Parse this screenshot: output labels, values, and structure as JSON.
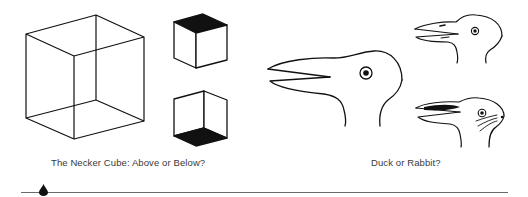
{
  "figures": [
    {
      "id": "necker",
      "caption": "The Necker Cube: Above or Below?",
      "drawings": [
        "wireframe-cube",
        "cube-viewed-from-above",
        "cube-viewed-from-below"
      ]
    },
    {
      "id": "duck-rabbit",
      "caption": "Duck or Rabbit?",
      "drawings": [
        "duck-rabbit-head",
        "duck-interpretation",
        "rabbit-interpretation"
      ]
    }
  ],
  "colors": {
    "ink": "#111111",
    "caption": "#3a3a3a",
    "rule": "#6a6a6a",
    "background": "#ffffff"
  },
  "rule_marker": {
    "icon": "teardrop-icon"
  }
}
